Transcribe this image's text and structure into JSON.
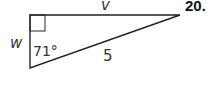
{
  "problem": {
    "number": "20.",
    "labels": {
      "top_side": "v",
      "left_side": "w",
      "hypotenuse": "5",
      "angle": "71°"
    },
    "colors": {
      "stroke": "#222222",
      "text": "#333333"
    }
  }
}
